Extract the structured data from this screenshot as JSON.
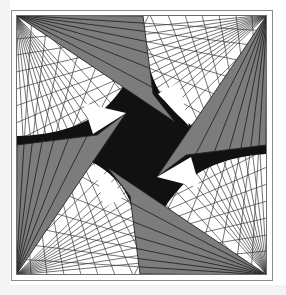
{
  "page": {
    "background_color": "#ffffff",
    "width": 286,
    "height": 295
  },
  "figure": {
    "name": "four-fold-rotational-line-fan-figure",
    "description": "Square framed op-art figure with four corner line fans, gray shaded wedges and a black pinwheel form with curved cusps",
    "symmetry": "4-fold rotational (90 degrees)",
    "colors": {
      "background": "#ffffff",
      "black_form": "#111111",
      "gray_wedge": "#7c7c7c",
      "line_stroke": "#2b2b2b",
      "frame_stroke": "#6e6e6e",
      "outer_margin_tint": "#f2f2f2"
    },
    "frame": {
      "name": "inner-square-frame",
      "x": 16,
      "y": 15,
      "width": 251,
      "height": 260,
      "stroke_width": 1
    },
    "outer_frame": {
      "name": "outer-square-frame",
      "x": 11,
      "y": 10,
      "width": 262,
      "height": 271,
      "stroke_width": 1
    },
    "fan_origins": [
      {
        "name": "fan-origin-top-left",
        "x": 16,
        "y": 15
      },
      {
        "name": "fan-origin-top-right",
        "x": 267,
        "y": 15
      },
      {
        "name": "fan-origin-bottom-right",
        "x": 267,
        "y": 275
      },
      {
        "name": "fan-origin-bottom-left",
        "x": 16,
        "y": 275
      }
    ],
    "ray_count_per_fan": 17,
    "gray_wedge_ray_count": 9,
    "quadrants": [
      {
        "name": "quadrant-top-left",
        "rotation_deg": 0
      },
      {
        "name": "quadrant-top-right",
        "rotation_deg": 90
      },
      {
        "name": "quadrant-bottom-right",
        "rotation_deg": 180
      },
      {
        "name": "quadrant-bottom-left",
        "rotation_deg": 270
      }
    ],
    "cusp_points": [
      {
        "name": "cusp-top",
        "x": 143,
        "y": 16
      },
      {
        "name": "cusp-right",
        "x": 266,
        "y": 145
      },
      {
        "name": "cusp-bottom",
        "x": 140,
        "y": 274
      },
      {
        "name": "cusp-left",
        "x": 17,
        "y": 145
      }
    ]
  }
}
